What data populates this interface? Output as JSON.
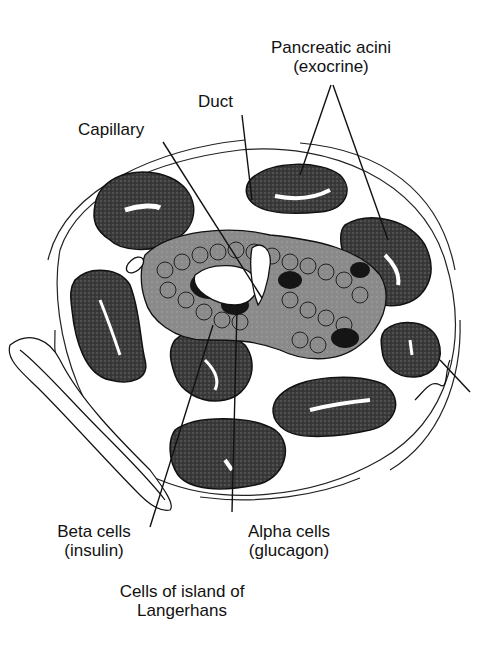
{
  "diagram": {
    "labels": {
      "acini_line1": "Pancreatic acini",
      "acini_line2": "(exocrine)",
      "duct": "Duct",
      "capillary": "Capillary",
      "beta_line1": "Beta cells",
      "beta_line2": "(insulin)",
      "alpha_line1": "Alpha cells",
      "alpha_line2": "(glucagon)",
      "group_line1": "Cells of island of",
      "group_line2": "Langerhans"
    },
    "colors": {
      "ink": "#111111",
      "acinus_fill": "#3a3a3a",
      "islet_cell_fill": "#8a8a8a",
      "alpha_fill": "#151515",
      "background": "#ffffff"
    }
  }
}
